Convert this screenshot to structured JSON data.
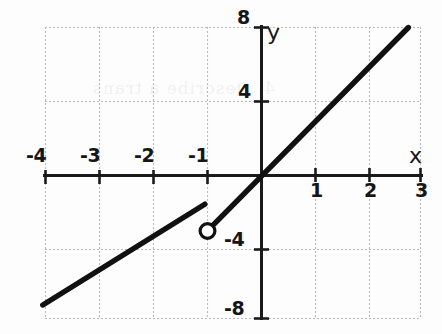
{
  "chart_data": {
    "type": "line",
    "title": "",
    "xlabel": "x",
    "ylabel": "y",
    "xlim": [
      -4.35,
      3.2
    ],
    "ylim": [
      -8.6,
      8.6
    ],
    "grid": true,
    "grid_style": "dotted",
    "grid_spacing_x": 1,
    "grid_spacing_y": 4,
    "legend": "none",
    "x_ticks": [
      -4,
      -3,
      -2,
      -1,
      1,
      2,
      3
    ],
    "x_tick_labels": [
      "-4",
      "-3",
      "-2",
      "-1",
      "1",
      "2",
      "3"
    ],
    "y_ticks": [
      -8,
      -4,
      4,
      8
    ],
    "y_tick_labels": [
      "-8",
      "-4",
      "4",
      "8"
    ],
    "negative_x_labels_above_axis": true,
    "positive_x_labels_below_axis": true,
    "series": [
      {
        "name": "left-branch",
        "type": "segment",
        "endpoint_style": [
          "none",
          "none"
        ],
        "points": [
          {
            "x": -4.05,
            "y": -7.0
          },
          {
            "x": -1.05,
            "y": -1.55
          }
        ]
      },
      {
        "name": "right-branch",
        "type": "ray",
        "endpoint_style": [
          "open-circle",
          "none"
        ],
        "points": [
          {
            "x": -1.02,
            "y": -3.05
          },
          {
            "x": 2.72,
            "y": 8.0
          }
        ]
      }
    ],
    "open_points": [
      {
        "x": -1,
        "y": -3
      }
    ],
    "annotations": []
  },
  "axes": {
    "x_axis_label": "x",
    "y_axis_label": "y",
    "x_labels_negative": [
      "-4",
      "-3",
      "-2",
      "-1"
    ],
    "x_labels_positive": [
      "1",
      "2",
      "3"
    ],
    "y_labels_upper": [
      "8",
      "4"
    ],
    "y_labels_lower": [
      "-4",
      "-8"
    ]
  },
  "style": {
    "curve_color": "#111111",
    "axis_color": "#1a1a1a",
    "grid_color": "#b9b9bd",
    "background": "#fdfdfd",
    "label_color": "#161616"
  },
  "artifacts": {
    "bleed_text": "4. Describe a trans"
  }
}
